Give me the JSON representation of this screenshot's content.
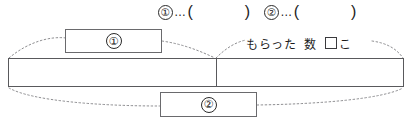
{
  "worksheet": {
    "answer_line": {
      "items": [
        {
          "marker": "①",
          "ellipsis": "…",
          "paren_open": "(",
          "value": "",
          "paren_close": ")"
        },
        {
          "marker": "②",
          "ellipsis": "…",
          "paren_open": "(",
          "value": "",
          "paren_close": ")"
        }
      ]
    },
    "tape_diagram": {
      "segments": [
        {
          "name": "left-segment",
          "value": ""
        },
        {
          "name": "right-segment",
          "value": ""
        }
      ],
      "divider": "|"
    },
    "callouts": [
      {
        "id": "callout-1",
        "marker": "①",
        "points_to": "left-segment"
      },
      {
        "id": "callout-2",
        "marker": "②",
        "points_to": "whole-tape"
      }
    ],
    "annotation": {
      "text_1": "もらった",
      "text_2": "数",
      "box": "□",
      "counter": "こ"
    }
  }
}
